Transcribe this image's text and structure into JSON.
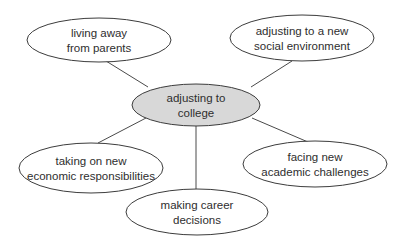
{
  "diagram": {
    "type": "spider-map",
    "center": {
      "lines": [
        "adjusting to",
        "college"
      ],
      "cx": 196,
      "cy": 105,
      "rx": 64,
      "ry": 21,
      "fill": "#d8d8d8"
    },
    "nodes": [
      {
        "id": "top-left",
        "lines": [
          "living away",
          "from parents"
        ],
        "cx": 99,
        "cy": 40,
        "rx": 72,
        "ry": 22,
        "edge": [
          106,
          61,
          148,
          87
        ]
      },
      {
        "id": "top-right",
        "lines": [
          "adjusting to a new",
          "social environment"
        ],
        "cx": 302,
        "cy": 38,
        "rx": 72,
        "ry": 23,
        "edge": [
          292,
          61,
          251,
          87
        ]
      },
      {
        "id": "bottom-left",
        "lines": [
          "taking on new",
          "economic responsibilities"
        ],
        "cx": 91,
        "cy": 168,
        "rx": 72,
        "ry": 25,
        "edge": [
          146,
          118,
          98,
          143
        ]
      },
      {
        "id": "bottom-right",
        "lines": [
          "facing new",
          "academic challenges"
        ],
        "cx": 315,
        "cy": 164,
        "rx": 72,
        "ry": 23,
        "edge": [
          252,
          118,
          308,
          142
        ]
      },
      {
        "id": "bottom",
        "lines": [
          "making career",
          "decisions"
        ],
        "cx": 197,
        "cy": 212,
        "rx": 71,
        "ry": 23,
        "edge": [
          196,
          126,
          196,
          189
        ]
      }
    ],
    "colors": {
      "stroke": "#3c3c3c",
      "text": "#2e2e2e",
      "background": "#ffffff"
    }
  }
}
